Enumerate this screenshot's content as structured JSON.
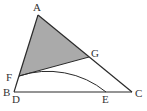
{
  "diagram": {
    "type": "geometry",
    "colors": {
      "line": "#2a2a2a",
      "shade": "#aaaaaa",
      "background": "#ffffff"
    },
    "points": {
      "A": {
        "label": "A",
        "x": 38,
        "y": 15
      },
      "B": {
        "label": "B",
        "x": 14,
        "y": 92
      },
      "C": {
        "label": "C",
        "x": 132,
        "y": 92
      },
      "D": {
        "label": "D",
        "x": 14,
        "y": 92
      },
      "E": {
        "label": "E",
        "x": 106,
        "y": 92
      },
      "F": {
        "label": "F",
        "x": 19,
        "y": 76
      },
      "G": {
        "label": "G",
        "x": 89,
        "y": 57
      }
    },
    "labels": {
      "A": "A",
      "B": "B",
      "C": "C",
      "D": "D",
      "E": "E",
      "F": "F",
      "G": "G"
    },
    "segments": [
      "AB",
      "BC",
      "CA",
      "FG"
    ],
    "shaded_region": "AFG",
    "arc": {
      "from": "F",
      "through": "G",
      "to": "E",
      "center": "D"
    }
  }
}
